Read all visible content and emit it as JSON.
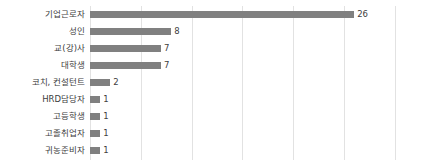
{
  "chart_data": {
    "type": "bar",
    "orientation": "horizontal",
    "title": "",
    "subtitle": "",
    "xlabel": "",
    "ylabel": "",
    "categories": [
      "기업근로자",
      "성인",
      "교(강)사",
      "대학생",
      "코치, 컨설턴트",
      "HRD담당자",
      "고등학생",
      "고졸취업자",
      "귀농준비자"
    ],
    "values": [
      26,
      8,
      7,
      7,
      2,
      1,
      1,
      1,
      1
    ],
    "value_labels": [
      "26",
      "8",
      "7",
      "7",
      "2",
      "1",
      "1",
      "1",
      "1"
    ],
    "xlim": [
      0,
      31.5
    ],
    "gridline_values": [
      0,
      5,
      10,
      15,
      20,
      25,
      30
    ],
    "grid": true,
    "legend": false,
    "legend_position": "none",
    "colors": {
      "bar": "#808080",
      "grid": "#e2e2e2",
      "text": "#404040",
      "background": "#ffffff"
    }
  }
}
